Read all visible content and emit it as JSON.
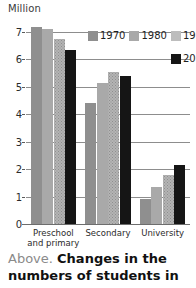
{
  "chart_data": {
    "type": "bar",
    "title": "",
    "ylabel": "Million",
    "xlabel": "",
    "ylim": [
      0,
      7
    ],
    "yticks": [
      "0",
      "1",
      "2",
      "3",
      "4",
      "5",
      "6",
      "7"
    ],
    "grid": true,
    "legend_position": "top-right",
    "categories": [
      "Preschool and primary",
      "Secondary",
      "University"
    ],
    "category_lines": [
      [
        "Preschool",
        "and primary"
      ],
      [
        "Secondary"
      ],
      [
        "University"
      ]
    ],
    "series": [
      {
        "name": "1970",
        "color": "#8f8f8f",
        "values": [
          7.2,
          4.4,
          0.9
        ]
      },
      {
        "name": "1980",
        "color": "#a9a9a9",
        "values": [
          7.1,
          5.15,
          1.35
        ]
      },
      {
        "name": "1990",
        "color": "#bdbdbd",
        "values": [
          6.75,
          5.55,
          1.8
        ]
      },
      {
        "name": "2000",
        "color": "#151515",
        "values": [
          6.35,
          5.4,
          2.15
        ]
      }
    ]
  },
  "caption": {
    "lead": "Above.",
    "text": "Changes in the numbers of students in"
  }
}
